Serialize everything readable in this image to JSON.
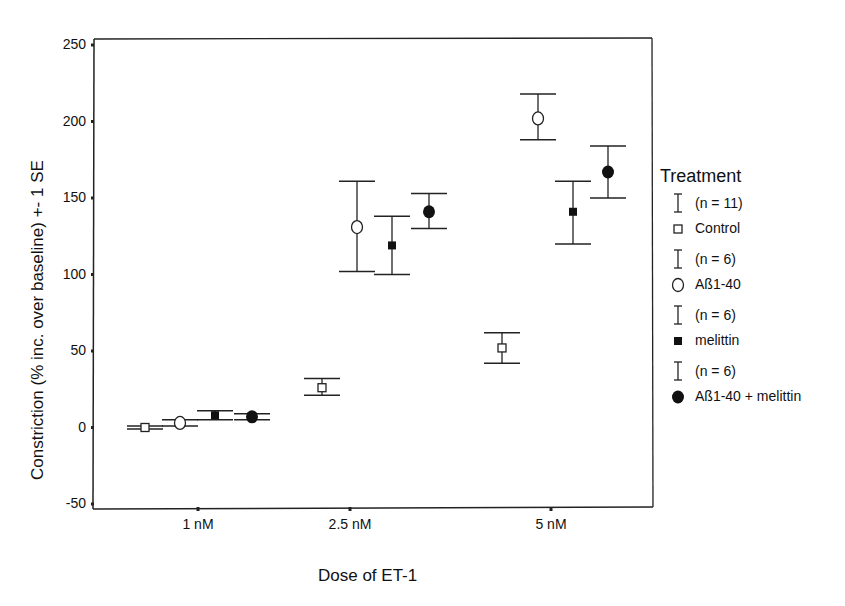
{
  "chart_data": {
    "type": "scatter",
    "subtype": "error-bar-plot",
    "title": "",
    "xlabel": "Dose of ET-1",
    "ylabel": "Constriction (% inc. over baseline) +- 1 SE",
    "categories": [
      "1 nM",
      "2.5 nM",
      "5 nM"
    ],
    "ylim": [
      -50,
      250
    ],
    "yticks": [
      -50,
      0,
      50,
      100,
      150,
      200,
      250
    ],
    "grid": false,
    "legend_position": "right",
    "legend_title": "Treatment",
    "series": [
      {
        "name": "Control",
        "n_label": "(n = 11)",
        "marker": "open-square",
        "values": [
          0,
          26,
          52
        ],
        "lower": [
          -1,
          21,
          42
        ],
        "upper": [
          1,
          32,
          62
        ]
      },
      {
        "name": "Aß1-40",
        "n_label": "(n = 6)",
        "marker": "open-circle",
        "values": [
          3,
          131,
          202
        ],
        "lower": [
          1,
          102,
          188
        ],
        "upper": [
          5,
          161,
          218
        ]
      },
      {
        "name": "melittin",
        "n_label": "(n = 6)",
        "marker": "filled-square",
        "values": [
          8,
          119,
          141
        ],
        "lower": [
          5,
          100,
          120
        ],
        "upper": [
          11,
          138,
          161
        ]
      },
      {
        "name": "Aß1-40 + melittin",
        "n_label": "(n = 6)",
        "marker": "filled-circle",
        "values": [
          7,
          141,
          167
        ],
        "lower": [
          5,
          130,
          150
        ],
        "upper": [
          9,
          153,
          184
        ]
      }
    ]
  }
}
